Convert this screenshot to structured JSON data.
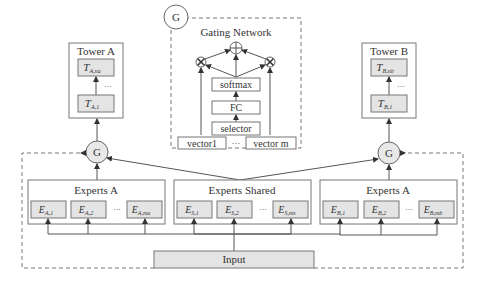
{
  "gating_network": {
    "badge": "G",
    "title": "Gating Network",
    "layers": [
      "softmax",
      "FC",
      "selector"
    ],
    "vectors": [
      "vector1",
      "vector m"
    ],
    "ellipsis": "···",
    "multiply_symbol": "⊗",
    "sum_symbol": "⊕"
  },
  "tower_a": {
    "title": "Tower A",
    "top": {
      "base": "T",
      "sub": "A,na"
    },
    "bottom": {
      "base": "T",
      "sub": "A,1"
    },
    "ellipsis": "···"
  },
  "tower_b": {
    "title": "Tower B",
    "top": {
      "base": "T",
      "sub": "B,nb"
    },
    "bottom": {
      "base": "T",
      "sub": "B,1"
    },
    "ellipsis": "···"
  },
  "gate_nodes": {
    "left": "G",
    "right": "G"
  },
  "experts_left": {
    "title": "Experts A",
    "items": [
      {
        "base": "E",
        "sub": "A,1"
      },
      {
        "base": "E",
        "sub": "A,2"
      },
      {
        "base": "E",
        "sub": "A,ma"
      }
    ],
    "ellipsis": "···"
  },
  "experts_shared": {
    "title": "Experts Shared",
    "items": [
      {
        "base": "E",
        "sub": "S,1"
      },
      {
        "base": "E",
        "sub": "S,2"
      },
      {
        "base": "E",
        "sub": "S,ms"
      }
    ],
    "ellipsis": "···"
  },
  "experts_right": {
    "title": "Experts A",
    "items": [
      {
        "base": "E",
        "sub": "B,1"
      },
      {
        "base": "E",
        "sub": "B,2"
      },
      {
        "base": "E",
        "sub": "B,mb"
      }
    ],
    "ellipsis": "···"
  },
  "input": {
    "label": "Input"
  },
  "colors": {
    "stroke": "#777777",
    "box_fill_gray": "#e4e4e4",
    "text": "#333333"
  }
}
